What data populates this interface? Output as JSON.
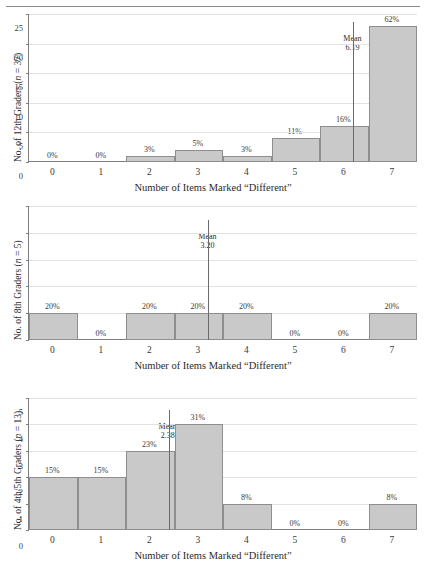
{
  "figure": {
    "x_axis_title": "Number of Items Marked “Different”",
    "x_tick_labels": [
      "0",
      "1",
      "2",
      "3",
      "4",
      "5",
      "6",
      "7"
    ],
    "mean_label": "Mean",
    "bar_fill": "#c9c9c9",
    "bar_stroke": "#8e8e8e",
    "grid_color": "#e2e2e2",
    "axis_color": "#7d7d7d"
  },
  "chart_data": [
    {
      "type": "bar",
      "id": "grade-12",
      "title": "",
      "ylabel": "No. of 12th Graders (n = 37)",
      "ylabel_prefix": "No. of 12th Graders (",
      "ylabel_n": "n",
      "ylabel_suffix": " = 37)",
      "xlabel": "Number of Items Marked “Different”",
      "categories": [
        "0",
        "1",
        "2",
        "3",
        "4",
        "5",
        "6",
        "7"
      ],
      "values": [
        0,
        0,
        1,
        2,
        1,
        4,
        6,
        23
      ],
      "data_labels": [
        "0%",
        "0%",
        "3%",
        "5%",
        "3%",
        "11%",
        "16%",
        "62%"
      ],
      "ylim": [
        0,
        25
      ],
      "yticks": [
        0,
        5,
        10,
        15,
        20,
        25
      ],
      "ytick_labels": [
        "0",
        "5",
        "10",
        "15",
        "20",
        "25"
      ],
      "grid": true,
      "mean": 6.19,
      "mean_text": "6.19",
      "n": 37
    },
    {
      "type": "bar",
      "id": "grade-8",
      "title": "",
      "ylabel": "No. of 8th Graders (n = 5)",
      "ylabel_prefix": "No. of 8th Graders (",
      "ylabel_n": "n",
      "ylabel_suffix": " = 5)",
      "xlabel": "Number of Items Marked “Different”",
      "categories": [
        "0",
        "1",
        "2",
        "3",
        "4",
        "5",
        "6",
        "7"
      ],
      "values": [
        1,
        0,
        1,
        1,
        1,
        0,
        0,
        1
      ],
      "data_labels": [
        "20%",
        "0%",
        "20%",
        "20%",
        "20%",
        "0%",
        "0%",
        "20%"
      ],
      "ylim": [
        0,
        5
      ],
      "yticks": [
        0,
        1,
        2,
        3,
        4,
        5
      ],
      "ytick_labels": [
        "0",
        "1",
        "2",
        "3",
        "4",
        "5"
      ],
      "grid": true,
      "mean": 3.2,
      "mean_text": "3.20",
      "n": 5
    },
    {
      "type": "bar",
      "id": "grade-4-5",
      "title": "",
      "ylabel": "No. of 4th/5th Graders (n = 13)",
      "ylabel_prefix": "No. of 4th/5th Graders (",
      "ylabel_n": "n",
      "ylabel_suffix": " = 13)",
      "xlabel": "Number of Items Marked “Different”",
      "categories": [
        "0",
        "1",
        "2",
        "3",
        "4",
        "5",
        "6",
        "7"
      ],
      "values": [
        2,
        2,
        3,
        4,
        1,
        0,
        0,
        1
      ],
      "data_labels": [
        "15%",
        "15%",
        "23%",
        "31%",
        "8%",
        "0%",
        "0%",
        "8%"
      ],
      "ylim": [
        0,
        5
      ],
      "yticks": [
        0,
        1,
        2,
        3,
        4,
        5
      ],
      "ytick_labels": [
        "0",
        "1",
        "2",
        "3",
        "4",
        "5"
      ],
      "grid": true,
      "mean": 2.38,
      "mean_text": "2.38",
      "n": 13
    }
  ]
}
